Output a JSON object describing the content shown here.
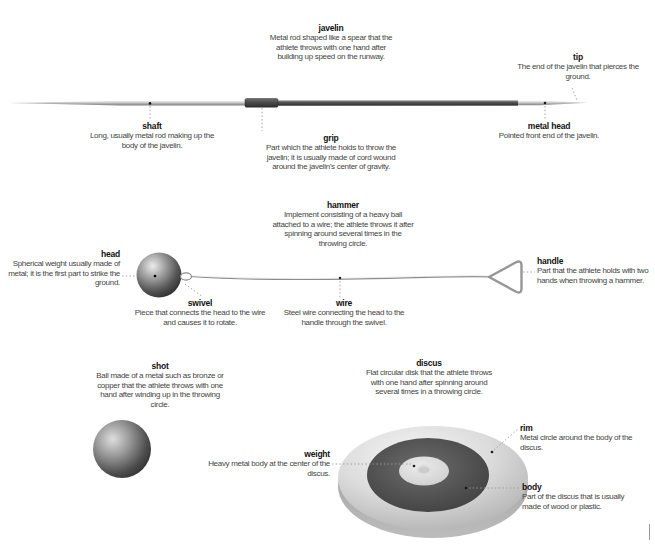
{
  "javelin": {
    "title": "javelin",
    "description": "Metal rod shaped like a spear that the athlete throws with one hand after building up speed on the runway.",
    "parts": {
      "tip": {
        "label": "tip",
        "description": "The end of the javelin that pierces the ground."
      },
      "shaft": {
        "label": "shaft",
        "description": "Long, usually metal rod making up the body of the javelin."
      },
      "grip": {
        "label": "grip",
        "description": "Part which the athlete holds to throw the javelin; it is usually made of cord wound around the javelin's center of gravity."
      },
      "metal_head": {
        "label": "metal head",
        "description": "Pointed front end of the javelin."
      }
    }
  },
  "hammer": {
    "title": "hammer",
    "description": "Implement consisting of a heavy ball attached to a wire; the athlete throws it after spinning around several times in the throwing circle.",
    "parts": {
      "head": {
        "label": "head",
        "description": "Spherical weight usually made of metal; it is the first part to strike the ground."
      },
      "handle": {
        "label": "handle",
        "description": "Part that the athlete holds with two hands when throwing a hammer."
      },
      "swivel": {
        "label": "swivel",
        "description": "Piece that connects the head to the wire and causes it to rotate."
      },
      "wire": {
        "label": "wire",
        "description": "Steel wire connecting the head to the handle through the swivel."
      }
    }
  },
  "shot": {
    "title": "shot",
    "description": "Ball made of a metal such as bronze or copper that the athlete throws with one hand after winding up in the throwing circle."
  },
  "discus": {
    "title": "discus",
    "description": "Flat circular disk that the athlete throws with one hand after spinning around several times in a throwing circle.",
    "parts": {
      "rim": {
        "label": "rim",
        "description": "Metal circle around the body of the discus."
      },
      "weight": {
        "label": "weight",
        "description": "Heavy metal body at the center of the discus."
      },
      "body": {
        "label": "body",
        "description": "Part of the discus that is usually made of wood or plastic."
      }
    }
  },
  "colors": {
    "leader": "#9a9a9a",
    "label": "#121212",
    "description": "#444444",
    "rod_dark": "#3a3a3a",
    "rod_silver": "#c6c6c6"
  }
}
